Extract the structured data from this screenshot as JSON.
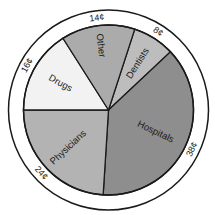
{
  "chart_data": {
    "type": "pie",
    "title": "",
    "unit": "cents",
    "start_angle_deg": 18,
    "direction": "clockwise",
    "slices": [
      {
        "label": "Dentists",
        "value": 8,
        "display": "8¢",
        "color": "#bdbdbd"
      },
      {
        "label": "Hospitals",
        "value": 38,
        "display": "38¢",
        "color": "#8e8e8e"
      },
      {
        "label": "Physicians",
        "value": 24,
        "display": "24¢",
        "color": "#b3b3b3"
      },
      {
        "label": "Drugs",
        "value": 16,
        "display": "16¢",
        "color": "#f2f2f2"
      },
      {
        "label": "Other",
        "value": 14,
        "display": "14¢",
        "color": "#ababab"
      }
    ],
    "legend": "none",
    "grid": false
  }
}
